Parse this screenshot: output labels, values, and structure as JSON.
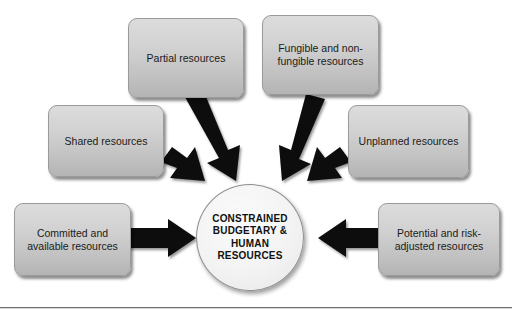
{
  "diagram": {
    "type": "converging-radial",
    "canvas": {
      "width": 512,
      "height": 319,
      "background": "#ffffff"
    },
    "style": {
      "box_fill_top": "#dcdcdc",
      "box_fill_bottom": "#b4b4b4",
      "box_border": "#9a9a9a",
      "circle_fill": "#f3f3f3",
      "circle_border": "#8f8f8f",
      "arrow_color": "#000000",
      "text_color": "#1a1a1a"
    },
    "center": {
      "label": "CONSTRAINED\nBUDGETARY &\nHUMAN\nRESOURCES",
      "shape": "circle",
      "x": 196,
      "y": 184,
      "width": 108,
      "height": 107
    },
    "nodes": [
      {
        "id": "partial",
        "label": "Partial resources",
        "x": 128,
        "y": 18,
        "width": 116,
        "height": 80,
        "arrow_direction": "down-right"
      },
      {
        "id": "fungible",
        "label": "Fungible and non-\nfungible resources",
        "x": 262,
        "y": 15,
        "width": 117,
        "height": 80,
        "arrow_direction": "down-left"
      },
      {
        "id": "shared",
        "label": "Shared resources",
        "x": 48,
        "y": 105,
        "width": 116,
        "height": 72,
        "arrow_direction": "down-right"
      },
      {
        "id": "unplanned",
        "label": "Unplanned resources",
        "x": 348,
        "y": 105,
        "width": 121,
        "height": 73,
        "arrow_direction": "down-left"
      },
      {
        "id": "committed",
        "label": "Committed and\navailable resources",
        "x": 14,
        "y": 203,
        "width": 117,
        "height": 73,
        "arrow_direction": "right"
      },
      {
        "id": "potential",
        "label": "Potential and risk-\nadjusted resources",
        "x": 378,
        "y": 203,
        "width": 122,
        "height": 73,
        "arrow_direction": "left"
      }
    ],
    "divider": {
      "y": 307
    }
  }
}
